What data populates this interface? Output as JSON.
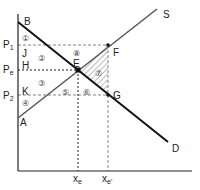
{
  "diagram": {
    "title": "",
    "curves": {
      "demand": {
        "label": "D",
        "start_label": "B"
      },
      "supply": {
        "label": "S",
        "start_label": "A"
      }
    },
    "points": {
      "equilibrium": "E",
      "supply_point": "F",
      "demand_point": "G",
      "j": "J",
      "h": "H",
      "k": "K"
    },
    "price_labels": {
      "p1": {
        "main": "P",
        "sub": "1"
      },
      "pe": {
        "main": "P",
        "sub": "e"
      },
      "p2": {
        "main": "P",
        "sub": "2"
      }
    },
    "quantity_labels": {
      "xe": {
        "main": "x",
        "sub": "e"
      },
      "xe_prime": {
        "main": "x",
        "sub": "e'"
      }
    },
    "regions": [
      "①",
      "②",
      "③",
      "④",
      "⑤",
      "⑥",
      "⑦",
      "⑧"
    ]
  }
}
